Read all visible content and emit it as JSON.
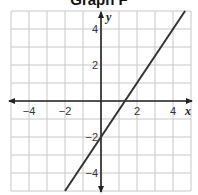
{
  "title": "Graph F",
  "chart_data": {
    "type": "line",
    "title": "Graph F",
    "xlabel": "x",
    "ylabel": "y",
    "xlim": [
      -5,
      5
    ],
    "ylim": [
      -5,
      5
    ],
    "grid": true,
    "x_ticks": [
      -4,
      -2,
      2,
      4
    ],
    "y_ticks": [
      4,
      2,
      -2,
      -4
    ],
    "x_tick_labels": [
      "−4",
      "−2",
      "2",
      "4"
    ],
    "y_tick_labels": [
      "4",
      "2",
      "−2",
      "−4"
    ],
    "series": [
      {
        "name": "line",
        "equation": "y = 1.5x - 2",
        "slope": 1.5,
        "y_intercept": -2,
        "x_intercept": 1.33,
        "x": [
          -2,
          0,
          1.33,
          4.67
        ],
        "y": [
          -5,
          -2,
          0,
          5
        ]
      }
    ],
    "colors": {
      "grid": "#c8c8c8",
      "axes": "#222222",
      "line": "#333333"
    }
  }
}
